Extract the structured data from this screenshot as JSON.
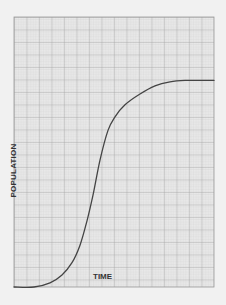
{
  "chart_data": {
    "type": "line",
    "title": "",
    "xlabel": "TIME",
    "ylabel": "POPULATION",
    "grid": true,
    "legend": null,
    "xlim": [
      0,
      100
    ],
    "ylim": [
      0,
      100
    ],
    "series": [
      {
        "name": "population",
        "color": "#444444",
        "x": [
          0,
          10,
          18,
          24,
          29,
          33,
          36.5,
          39.5,
          43,
          47,
          50.5,
          55.5,
          63,
          70.5,
          78,
          85.5,
          100
        ],
        "y": [
          0,
          0,
          1.5,
          4.5,
          9,
          15.5,
          24.5,
          34,
          47,
          58,
          63,
          67.5,
          71.5,
          74.5,
          76,
          76.5,
          76.5
        ]
      }
    ]
  },
  "colors": {
    "background": "#f1f1f1",
    "grid_fine": "#c8c8c8",
    "grid_major": "#9a9a9a",
    "curve": "#444444"
  }
}
